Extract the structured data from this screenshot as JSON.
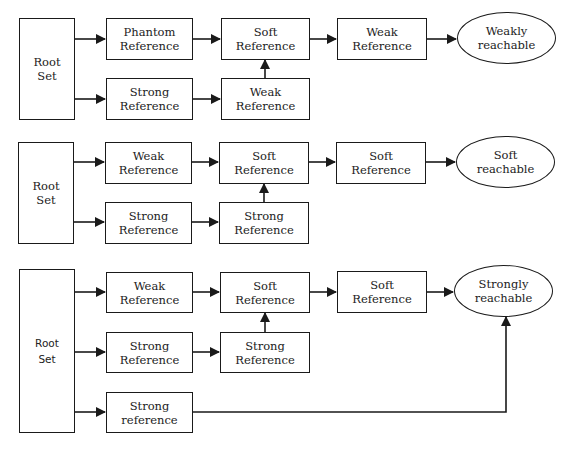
{
  "diagrams": [
    {
      "id": "weakly",
      "root": {
        "line1": "Root",
        "line2": "Set"
      },
      "row1": [
        {
          "line1": "Phantom",
          "line2": "Reference"
        },
        {
          "line1": "Soft",
          "line2": "Reference"
        },
        {
          "line1": "Weak",
          "line2": "Reference"
        }
      ],
      "row2": [
        {
          "line1": "Strong",
          "line2": "Reference"
        },
        {
          "line1": "Weak",
          "line2": "Reference"
        }
      ],
      "result": {
        "line1": "Weakly",
        "line2": "reachable"
      }
    },
    {
      "id": "soft",
      "root": {
        "line1": "Root",
        "line2": "Set"
      },
      "row1": [
        {
          "line1": "Weak",
          "line2": "Reference"
        },
        {
          "line1": "Soft",
          "line2": "Reference"
        },
        {
          "line1": "Soft",
          "line2": "Reference"
        }
      ],
      "row2": [
        {
          "line1": "Strong",
          "line2": "Reference"
        },
        {
          "line1": "Strong",
          "line2": "Reference"
        }
      ],
      "result": {
        "line1": "Soft",
        "line2": "reachable"
      }
    },
    {
      "id": "strongly",
      "root": {
        "line1": "Root",
        "line2": "Set"
      },
      "row1": [
        {
          "line1": "Weak",
          "line2": "Reference"
        },
        {
          "line1": "Soft",
          "line2": "Reference"
        },
        {
          "line1": "Soft",
          "line2": "Reference"
        }
      ],
      "row2": [
        {
          "line1": "Strong",
          "line2": "Reference"
        },
        {
          "line1": "Strong",
          "line2": "Reference"
        }
      ],
      "row3": [
        {
          "line1": "Strong",
          "line2": "reference"
        }
      ],
      "result": {
        "line1": "Strongly",
        "line2": "reachable"
      }
    }
  ],
  "colors": {
    "stroke": "#1a1a1a",
    "text": "#222222",
    "background": "#ffffff"
  }
}
